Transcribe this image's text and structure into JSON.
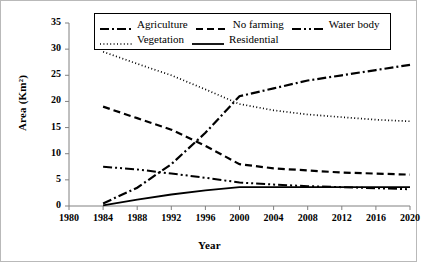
{
  "chart_data": {
    "type": "line",
    "title": "",
    "xlabel": "Year",
    "ylabel": "Area (Km2)",
    "ylabel_display": "Area (Km²)",
    "xlim": [
      1980,
      2020
    ],
    "ylim": [
      0,
      35
    ],
    "ytick_step": 5,
    "xtick_step": 4,
    "grid": false,
    "legend_position": "top-inside",
    "x": [
      1984,
      1988,
      1992,
      1996,
      2000,
      2004,
      2008,
      2012,
      2016,
      2020
    ],
    "xticks": [
      "1980",
      "1984",
      "1988",
      "1992",
      "1996",
      "2000",
      "2004",
      "2008",
      "2012",
      "2016",
      "2020"
    ],
    "yticks": [
      "0",
      "5",
      "10",
      "15",
      "20",
      "25",
      "30",
      "35"
    ],
    "series": [
      {
        "name": "Agriculture",
        "style": "dash-dot",
        "color": "#000000",
        "values": [
          0.5,
          3.5,
          8.0,
          14.0,
          21.0,
          22.5,
          24.0,
          25.0,
          26.0,
          27.0
        ]
      },
      {
        "name": "No farming",
        "style": "dashed",
        "color": "#000000",
        "values": [
          19.0,
          16.8,
          14.6,
          11.5,
          8.0,
          7.2,
          6.8,
          6.4,
          6.2,
          6.0
        ]
      },
      {
        "name": "Water body",
        "style": "dash-dot-dot",
        "color": "#000000",
        "values": [
          7.5,
          7.0,
          6.2,
          5.4,
          4.5,
          4.1,
          3.8,
          3.6,
          3.4,
          3.2
        ]
      },
      {
        "name": "Vegetation",
        "style": "dotted",
        "color": "#000000",
        "values": [
          29.5,
          27.2,
          25.0,
          22.3,
          19.5,
          18.3,
          17.5,
          17.0,
          16.5,
          16.2
        ]
      },
      {
        "name": "Residential",
        "style": "solid",
        "color": "#000000",
        "values": [
          0.1,
          1.2,
          2.2,
          3.0,
          3.6,
          3.6,
          3.6,
          3.6,
          3.6,
          3.6
        ]
      }
    ]
  },
  "legend": {
    "row1": [
      "Agriculture",
      "No farming",
      "Water body"
    ],
    "row2": [
      "Vegetation",
      "Residential"
    ]
  }
}
